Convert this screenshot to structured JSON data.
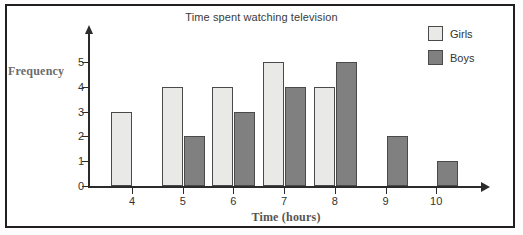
{
  "chart_data": {
    "type": "bar",
    "title": "Time spent watching television",
    "xlabel": "Time (hours)",
    "ylabel": "Frequency",
    "categories": [
      "4",
      "5",
      "6",
      "7",
      "8",
      "9",
      "10"
    ],
    "series": [
      {
        "name": "Girls",
        "color": "#e9e9e7",
        "values": [
          3,
          4,
          4,
          5,
          4,
          0,
          0
        ]
      },
      {
        "name": "Boys",
        "color": "#808080",
        "values": [
          0,
          2,
          3,
          4,
          5,
          2,
          1
        ]
      }
    ],
    "ylim": [
      0,
      5.6
    ],
    "yticks": [
      0,
      1,
      2,
      3,
      4,
      5
    ],
    "ytick_labels": [
      "0",
      "1",
      "2",
      "3",
      "4",
      "5"
    ],
    "grid": false,
    "legend_position": "top-right",
    "legend": [
      "Girls",
      "Boys"
    ]
  },
  "axes": {
    "y_ticks": [
      {
        "label": "5",
        "value": 5
      },
      {
        "label": "4",
        "value": 4
      },
      {
        "label": "3",
        "value": 3
      },
      {
        "label": "2",
        "value": 2
      },
      {
        "label": "1",
        "value": 1
      },
      {
        "label": "0",
        "value": 0
      }
    ],
    "x_ticks": [
      {
        "label": "4"
      },
      {
        "label": "5"
      },
      {
        "label": "6"
      },
      {
        "label": "7"
      },
      {
        "label": "8"
      },
      {
        "label": "9"
      },
      {
        "label": "10"
      }
    ]
  },
  "legend": {
    "items": [
      {
        "label": "Girls",
        "color": "#e9e9e7"
      },
      {
        "label": "Boys",
        "color": "#808080"
      }
    ]
  },
  "colors": {
    "girls": "#e9e9e7",
    "boys": "#808080",
    "axis": "#2b2b2b",
    "frame": "#231f20"
  }
}
